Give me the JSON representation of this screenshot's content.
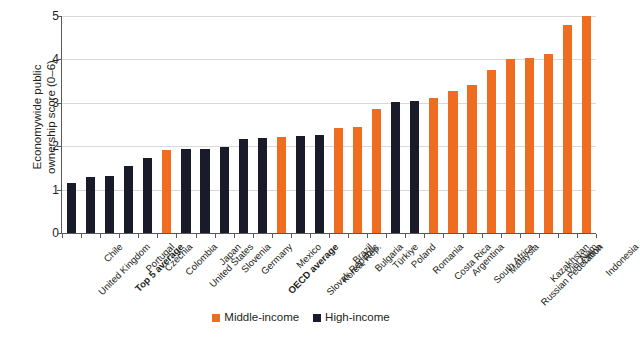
{
  "chart": {
    "type": "bar",
    "ylabel": "Economywide public\nownership score (0–6)",
    "yticks": [
      "0",
      "1",
      "2",
      "3",
      "4",
      "5"
    ],
    "legend": [
      {
        "label": "Middle-income",
        "color": "#ef6d21",
        "swatch_name": "legend-swatch-middle-income"
      },
      {
        "label": "High-income",
        "color": "#191b2b",
        "swatch_name": "legend-swatch-high-income"
      }
    ]
  },
  "chart_data": {
    "type": "bar",
    "title": "",
    "subtitle": "",
    "xlabel": "",
    "ylabel": "Economywide public ownership score (0–6)",
    "ylim": [
      0,
      5
    ],
    "yticks": [
      0,
      1,
      2,
      3,
      4,
      5
    ],
    "grid": true,
    "legend_position": "bottom",
    "categories": [
      "United Kingdom",
      "Chile",
      "Top 5 average",
      "Portugal",
      "Czechia",
      "Colombia",
      "United States",
      "Japan",
      "Slovenia",
      "Germany",
      "OECD average",
      "Mexico",
      "Slovak Republic",
      "Korea, Rep.",
      "Brazil",
      "Bulgaria",
      "Türkiye",
      "Poland",
      "Romania",
      "Costa Rica",
      "Argentina",
      "South Africa",
      "Malaysia",
      "Russian Federation",
      "Kazakhstan",
      "Viet Nam",
      "China",
      "Indonesia"
    ],
    "values": [
      1.15,
      1.3,
      1.32,
      1.55,
      1.72,
      1.92,
      1.93,
      1.94,
      1.98,
      2.17,
      2.19,
      2.21,
      2.23,
      2.25,
      2.41,
      2.45,
      2.86,
      3.02,
      3.05,
      3.12,
      3.28,
      3.42,
      3.76,
      4.0,
      4.03,
      4.12,
      4.8,
      5.0
    ],
    "groups": [
      "High-income",
      "High-income",
      "High-income",
      "High-income",
      "High-income",
      "Middle-income",
      "High-income",
      "High-income",
      "High-income",
      "High-income",
      "High-income",
      "Middle-income",
      "High-income",
      "High-income",
      "Middle-income",
      "Middle-income",
      "Middle-income",
      "High-income",
      "High-income",
      "Middle-income",
      "Middle-income",
      "Middle-income",
      "Middle-income",
      "Middle-income",
      "Middle-income",
      "Middle-income",
      "Middle-income",
      "Middle-income"
    ],
    "bold_categories": [
      "Top 5 average",
      "OECD average"
    ],
    "series": [
      {
        "name": "Middle-income",
        "color": "#ef6d21",
        "values": [
          null,
          null,
          null,
          null,
          null,
          1.92,
          null,
          null,
          null,
          null,
          null,
          2.21,
          null,
          null,
          2.41,
          2.45,
          2.86,
          null,
          null,
          3.12,
          3.28,
          3.42,
          3.76,
          4.0,
          4.03,
          4.12,
          4.8,
          5.0
        ]
      },
      {
        "name": "High-income",
        "color": "#191b2b",
        "values": [
          1.15,
          1.3,
          1.32,
          1.55,
          1.72,
          null,
          1.93,
          1.94,
          1.98,
          2.17,
          2.19,
          null,
          2.23,
          2.25,
          null,
          null,
          null,
          3.02,
          3.05,
          null,
          null,
          null,
          null,
          null,
          null,
          null,
          null,
          null
        ]
      }
    ]
  }
}
